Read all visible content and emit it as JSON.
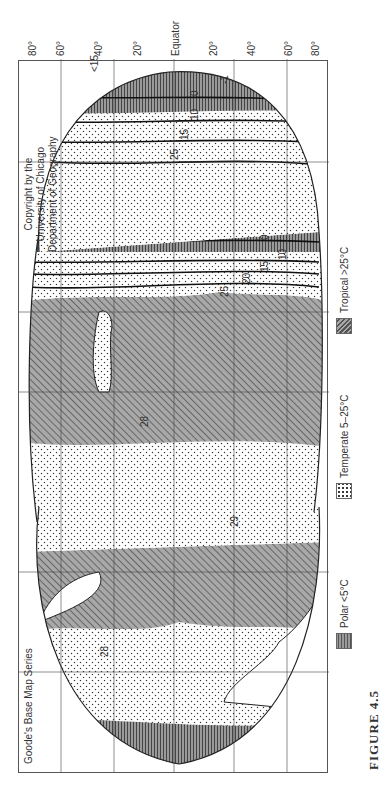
{
  "figure": {
    "label": "FIGURE 4.5",
    "series_title": "Goode's Base Map Series",
    "copyright_lines": [
      "Copyright by the",
      "University of Chicago",
      "Department of Geography"
    ]
  },
  "latitude_labels": [
    "80°",
    "60°",
    "40°",
    "20°",
    "Equator",
    "20°",
    "40°",
    "60°",
    "80°"
  ],
  "legend": {
    "items": [
      {
        "label": "Polar <5°C",
        "pattern": "horizontal-lines",
        "color": "#8a8a8a"
      },
      {
        "label": "Temperate 5–25°C",
        "pattern": "dots",
        "color": "#ffffff"
      },
      {
        "label": "Tropical >25°C",
        "pattern": "diagonal-hatch",
        "color": "#9a9a9a"
      }
    ]
  },
  "isotherm_labels": {
    "atlantic": [
      "10",
      "15",
      "20",
      "25",
      "25",
      "25",
      "20",
      "15",
      "10",
      "5",
      "0",
      "-1"
    ],
    "pacific": [
      "28",
      "29",
      "25",
      "20",
      "15",
      "10",
      "5",
      "0"
    ],
    "indian": [
      "10",
      "15",
      "20",
      "25",
      "27",
      "25",
      "20",
      "20",
      "<15",
      "15",
      "10",
      "5",
      "0",
      "-1"
    ],
    "north_atlantic_europe": [
      "15",
      "20",
      "25",
      "28"
    ]
  },
  "colors": {
    "tropical_fill": "#9a9a9a",
    "polar_fill": "#8a8a8a",
    "outline": "#222222",
    "grid": "#444444"
  }
}
